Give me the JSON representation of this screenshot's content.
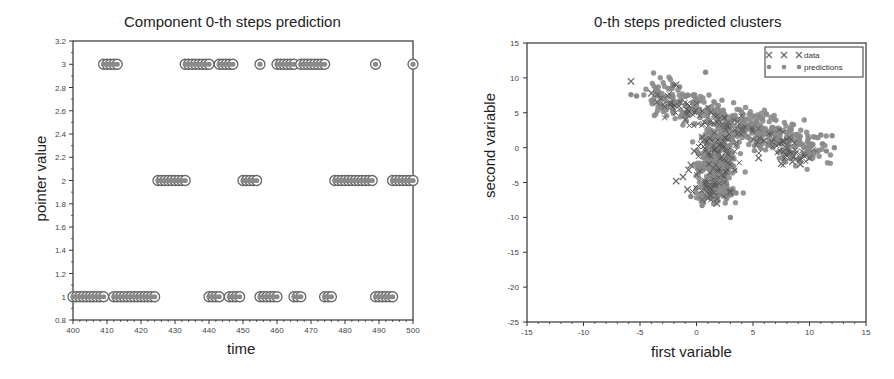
{
  "chart_data": [
    {
      "type": "scatter",
      "title": "Component 0-th steps prediction",
      "xlabel": "time",
      "ylabel": "pointer value",
      "xlim": [
        400,
        500
      ],
      "ylim": [
        0.8,
        3.2
      ],
      "xticks": [
        400,
        410,
        420,
        430,
        440,
        450,
        460,
        470,
        480,
        490,
        500
      ],
      "yticks": [
        0.8,
        1,
        1.2,
        1.4,
        1.6,
        1.8,
        2,
        2.2,
        2.4,
        2.6,
        2.8,
        3,
        3.2
      ],
      "ytick_labels": [
        "0.8",
        "1",
        "1.2",
        "1.4",
        "1.6",
        "1.8",
        "2",
        "2.2",
        "2.4",
        "2.6",
        "2.8",
        "3",
        "3.2"
      ],
      "grid": false,
      "marker": "circle-dot",
      "series": [
        {
          "name": "pointer = 3",
          "y": 3,
          "x_ranges": [
            [
              409,
              413
            ],
            [
              433,
              440
            ],
            [
              443,
              447
            ],
            [
              455,
              455
            ],
            [
              460,
              465
            ],
            [
              467,
              474
            ],
            [
              489,
              489
            ],
            [
              500,
              500
            ]
          ]
        },
        {
          "name": "pointer = 2",
          "y": 2,
          "x_ranges": [
            [
              425,
              433
            ],
            [
              450,
              454
            ],
            [
              477,
              488
            ],
            [
              494,
              500
            ]
          ]
        },
        {
          "name": "pointer = 1",
          "y": 1,
          "x_ranges": [
            [
              400,
              409
            ],
            [
              412,
              424
            ],
            [
              440,
              443
            ],
            [
              446,
              449
            ],
            [
              455,
              460
            ],
            [
              465,
              467
            ],
            [
              474,
              476
            ],
            [
              489,
              494
            ]
          ]
        }
      ]
    },
    {
      "type": "scatter",
      "title": "0-th steps predicted clusters",
      "xlabel": "first variable",
      "ylabel": "second variable",
      "xlim": [
        -15,
        15
      ],
      "ylim": [
        -25,
        15
      ],
      "xticks": [
        -15,
        -10,
        -5,
        0,
        5,
        10,
        15
      ],
      "yticks": [
        -25,
        -20,
        -15,
        -10,
        -5,
        0,
        5,
        10,
        15
      ],
      "grid": false,
      "legend": {
        "position": "upper right",
        "entries": [
          "data",
          "predictions"
        ]
      },
      "series": [
        {
          "name": "data",
          "marker": "x",
          "sample_points": [
            [
              -5.8,
              9.5
            ],
            [
              -4,
              7.8
            ],
            [
              -3.5,
              6.5
            ],
            [
              -1.8,
              9
            ],
            [
              -0.2,
              -0.5
            ],
            [
              -0.5,
              -2.5
            ],
            [
              -0.7,
              -3.2
            ],
            [
              -1.2,
              -4.2
            ],
            [
              -1.8,
              -4.8
            ],
            [
              -0.8,
              -6
            ],
            [
              0.5,
              -7.5
            ],
            [
              1.8,
              -8.0
            ],
            [
              1.0,
              -7.2
            ],
            [
              3.0,
              -6.5
            ],
            [
              5.5,
              -1.5
            ],
            [
              7.5,
              -2.3
            ],
            [
              8.5,
              -2.0
            ],
            [
              10,
              -1.5
            ],
            [
              9.2,
              -2.4
            ],
            [
              4,
              2.5
            ],
            [
              2.5,
              3
            ],
            [
              6,
              1
            ],
            [
              8,
              0.5
            ],
            [
              0.5,
              1.5
            ],
            [
              -1,
              4
            ]
          ]
        },
        {
          "name": "predictions",
          "marker": "dot",
          "sample_points": [
            [
              -5.8,
              7.6
            ],
            [
              -5.3,
              7.4
            ],
            [
              -3.5,
              8.2
            ],
            [
              -2.5,
              8.5
            ],
            [
              -1.5,
              8.7
            ],
            [
              0.8,
              10.8
            ],
            [
              -3,
              7
            ],
            [
              -2,
              6.5
            ],
            [
              -1,
              6
            ],
            [
              0,
              5.5
            ],
            [
              1,
              5
            ],
            [
              2,
              4
            ],
            [
              3,
              3.5
            ],
            [
              4,
              3
            ],
            [
              5,
              2.5
            ],
            [
              6,
              2
            ],
            [
              7,
              1.5
            ],
            [
              8,
              1
            ],
            [
              9,
              0.5
            ],
            [
              10,
              0.5
            ],
            [
              10.5,
              1.5
            ],
            [
              11,
              1.8
            ],
            [
              12,
              1.7
            ],
            [
              12.2,
              0
            ],
            [
              11.5,
              -0.5
            ],
            [
              1,
              0
            ],
            [
              1.5,
              -1
            ],
            [
              2,
              -2
            ],
            [
              2.5,
              -3
            ],
            [
              1.5,
              -4
            ],
            [
              2,
              -5
            ],
            [
              2.8,
              -6
            ],
            [
              1.5,
              -6.5
            ],
            [
              0.8,
              -7
            ],
            [
              3,
              -10
            ],
            [
              0.5,
              -8.3
            ],
            [
              -0.5,
              -7.0
            ],
            [
              3.5,
              -6.5
            ]
          ]
        }
      ]
    }
  ],
  "left": {
    "title": "Component 0-th steps prediction",
    "xlabel": "time",
    "ylabel": "pointer value"
  },
  "right": {
    "title": "0-th steps predicted clusters",
    "xlabel": "first variable",
    "ylabel": "second variable",
    "legend_data": "data",
    "legend_predictions": "predictions"
  },
  "colors": {
    "axis": "#333333",
    "marker_fill": "#8a8a8a",
    "marker_edge": "#666666",
    "x_marker": "#6a6a6a",
    "text": "#222222"
  }
}
